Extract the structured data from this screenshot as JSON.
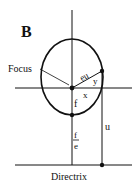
{
  "diagram": {
    "panel_label": "B",
    "labels": {
      "focus": "Focus",
      "eu": "eu",
      "y": "y",
      "x": "x",
      "f": "f",
      "f_over_e_num": "f",
      "f_over_e_den": "e",
      "u": "u",
      "directrix": "Directrix"
    },
    "colors": {
      "stroke": "#111111",
      "background": "#ffffff"
    }
  }
}
